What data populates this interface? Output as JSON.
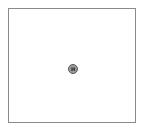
{
  "canvas": {
    "border_color": "#8a8a8a",
    "background": "#ffffff"
  },
  "marker": {
    "label": "H",
    "icon": "circle-h-icon",
    "fill_color": "#9a9a9a",
    "stroke_color": "#5a5a5a"
  }
}
